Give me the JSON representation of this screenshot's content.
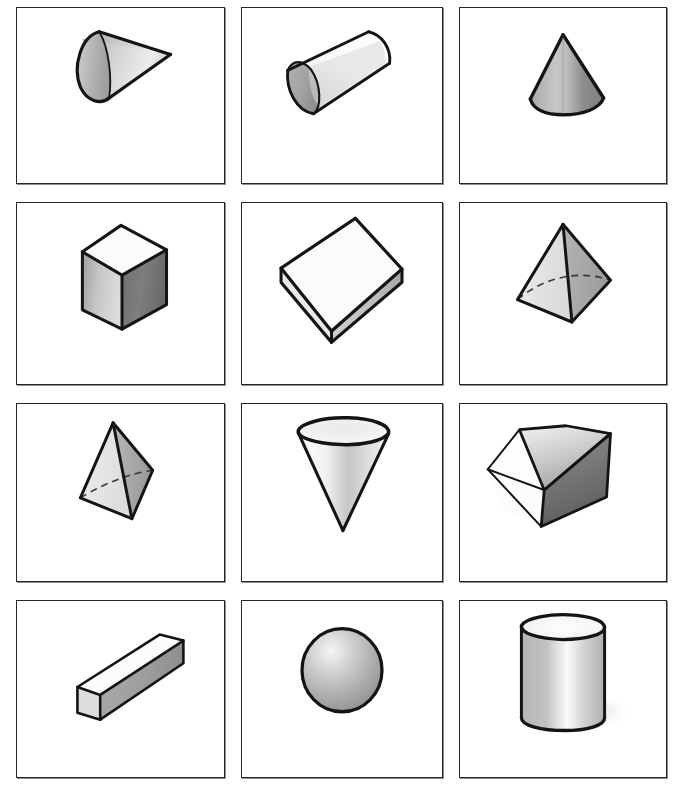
{
  "page": {
    "background_color": "#ffffff",
    "frame_color": "#262626",
    "ink_color": "#141414",
    "columns": 3,
    "rows": 4,
    "total_cells": 12
  },
  "palette": {
    "white_face": "#fdfdfd",
    "light_gray": "#e3e3e3",
    "mid_gray": "#b9b9b9",
    "dark_gray": "#8a8a8a",
    "darker_gray": "#6d6d6d",
    "shadow_gray": "#c9c9c9",
    "outline": "#141414"
  },
  "cells": [
    {
      "index": 1,
      "row": 1,
      "column": 1,
      "shape": "cone",
      "orientation": "lying on side, apex pointing right",
      "label": "cone-pointing-right",
      "shading": "elliptical base lit at left, body graded light to mid gray"
    },
    {
      "index": 2,
      "row": 1,
      "column": 2,
      "shape": "cylinder",
      "orientation": "tilted diagonally, circular end facing lower-left",
      "label": "tilted-cylinder",
      "shading": "white body with gray speckled band, gray elliptical end cap"
    },
    {
      "index": 3,
      "row": 1,
      "column": 3,
      "shape": "cone",
      "orientation": "upright, apex at top",
      "label": "upright-cone",
      "shading": "medium gray with darker right side"
    },
    {
      "index": 4,
      "row": 2,
      "column": 1,
      "shape": "cube",
      "orientation": "isometric, corner toward viewer",
      "label": "cube-isometric",
      "shading": "white top face, mid gray left face, dark gray right face"
    },
    {
      "index": 5,
      "row": 2,
      "column": 2,
      "shape": "rectangular prism",
      "orientation": "flat slab lying down, seen from above",
      "label": "flat-rectangular-box",
      "shading": "white top, light gray front edge, gray right edge"
    },
    {
      "index": 6,
      "row": 2,
      "column": 3,
      "shape": "square pyramid",
      "orientation": "upright, apex at top, hidden base edges dashed",
      "label": "square-pyramid",
      "shading": "light gray left face, mid gray right face, dashed hidden edges"
    },
    {
      "index": 7,
      "row": 3,
      "column": 1,
      "shape": "tetrahedron",
      "orientation": "tilted, apex at top, hidden edge dashed",
      "label": "tetrahedron",
      "shading": "light gray left face, darker gray right face, dashed hidden edge"
    },
    {
      "index": 8,
      "row": 3,
      "column": 2,
      "shape": "cone",
      "orientation": "inverted, apex pointing down, open circular top",
      "label": "inverted-cone",
      "shading": "white with soft gray gradient down the centre"
    },
    {
      "index": 9,
      "row": 3,
      "column": 3,
      "shape": "cube",
      "orientation": "rotated, resting on an edge, hexagonal silhouette",
      "label": "cube-rotated-on-edge",
      "shading": "white left face, light gray upper-right face, dark gray lower-right face"
    },
    {
      "index": 10,
      "row": 4,
      "column": 1,
      "shape": "rectangular prism",
      "orientation": "long bar running diagonally from lower-left to upper-right",
      "label": "long-rectangular-bar",
      "shading": "white top, light gray square end, mid gray long front face"
    },
    {
      "index": 11,
      "row": 4,
      "column": 2,
      "shape": "sphere",
      "orientation": "centred, highlight at upper left",
      "label": "sphere",
      "shading": "radial gradient, light at upper-left fading to gray at lower-right"
    },
    {
      "index": 12,
      "row": 4,
      "column": 3,
      "shape": "cylinder",
      "orientation": "upright, standing on flat base",
      "label": "upright-cylinder",
      "shading": "gray body with vertical white highlight, white elliptical top, cast shadow right"
    }
  ]
}
